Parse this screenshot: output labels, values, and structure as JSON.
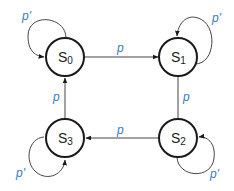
{
  "diagram": {
    "type": "state-machine",
    "colors": {
      "node_stroke": "#1a1a1a",
      "edge_stroke": "#444444",
      "label": "#3a78c8"
    },
    "states": [
      {
        "id": "S0",
        "letter": "S",
        "sub": "0"
      },
      {
        "id": "S1",
        "letter": "S",
        "sub": "1"
      },
      {
        "id": "S2",
        "letter": "S",
        "sub": "2"
      },
      {
        "id": "S3",
        "letter": "S",
        "sub": "3"
      }
    ],
    "transitions": [
      {
        "from": "S0",
        "to": "S1",
        "label": "p"
      },
      {
        "from": "S1",
        "to": "S2",
        "label": "p"
      },
      {
        "from": "S2",
        "to": "S3",
        "label": "p"
      },
      {
        "from": "S3",
        "to": "S0",
        "label": "p"
      },
      {
        "from": "S0",
        "to": "S0",
        "label": "p'"
      },
      {
        "from": "S1",
        "to": "S1",
        "label": "p'"
      },
      {
        "from": "S2",
        "to": "S2",
        "label": "p'"
      },
      {
        "from": "S3",
        "to": "S3",
        "label": "p'"
      }
    ]
  }
}
